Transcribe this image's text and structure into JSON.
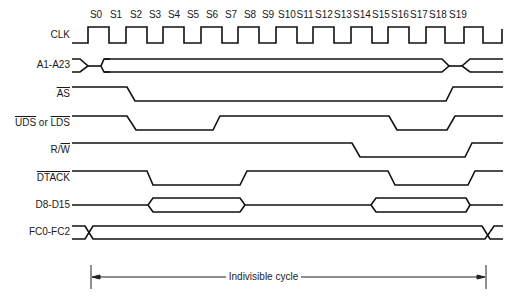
{
  "diagram": {
    "states": [
      "S0",
      "S1",
      "S2",
      "S3",
      "S4",
      "S5",
      "S6",
      "S7",
      "S8",
      "S9",
      "S10",
      "S11",
      "S12",
      "S13",
      "S14",
      "S15",
      "S16",
      "S17",
      "S18",
      "S19"
    ],
    "state_x": [
      96,
      116,
      136,
      155,
      174,
      193,
      212,
      231,
      250,
      268,
      287,
      305,
      324,
      343,
      362,
      381,
      400,
      419,
      438,
      458
    ],
    "signals": [
      {
        "name": "CLK",
        "label": "CLK",
        "y": 35
      },
      {
        "name": "address",
        "label": "A1-A23",
        "y": 65
      },
      {
        "name": "as",
        "label": "AS",
        "overline": true,
        "y": 94
      },
      {
        "name": "uds-lds",
        "label_a": "UDS",
        "label_mid": " or ",
        "label_b": "LDS",
        "y": 123
      },
      {
        "name": "rw",
        "label_a": "R/",
        "label_b": "W",
        "y": 150
      },
      {
        "name": "dtack",
        "label": "DTACK",
        "overline": true,
        "y": 178
      },
      {
        "name": "data",
        "label": "D8-D15",
        "y": 205
      },
      {
        "name": "fc",
        "label": "FC0-FC2",
        "y": 232
      }
    ],
    "caption": "Indivisible cycle",
    "line_color": "#111111"
  }
}
